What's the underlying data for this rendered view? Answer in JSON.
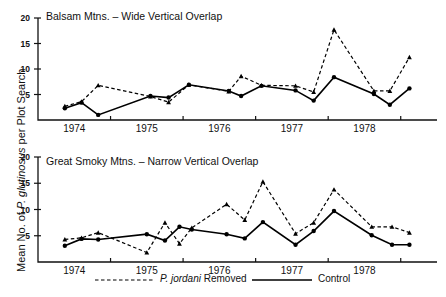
{
  "figure": {
    "y_axis_label": "Mean No. of P. glutinosus per Plot Search",
    "y_axis_label_pre": "Mean No. of ",
    "y_axis_label_italic": "P. glutinosus",
    "y_axis_label_post": " per Plot Search"
  },
  "legend": {
    "removed_pre": "",
    "removed_italic": "P. jordani",
    "removed_post": " Removed",
    "removed_label": "P. jordani Removed",
    "control_label": "Control"
  },
  "chart_data": [
    {
      "type": "line",
      "title": "Balsam Mtns. – Wide Vertical Overlap",
      "xlabel": "",
      "ylabel": "Mean No. of P. glutinosus per Plot Search",
      "ylim": [
        0,
        20
      ],
      "yticks": [
        5,
        10,
        15,
        20
      ],
      "ytick_labels": [
        "5",
        "10",
        "15",
        "20"
      ],
      "xlim": [
        1973.5,
        1979.0
      ],
      "xticks": [
        1973.5,
        1974.5,
        1975.5,
        1976.5,
        1977.5,
        1978.5
      ],
      "xtick_labels": [
        "1974",
        "1975",
        "1976",
        "1977",
        "1978"
      ],
      "grid": false,
      "legend_position": "below-figure",
      "series": [
        {
          "name": "P. jordani Removed",
          "style": "dashed",
          "marker": "triangle",
          "x": [
            1973.87,
            1974.1,
            1974.33,
            1975.05,
            1975.3,
            1975.58,
            1976.13,
            1976.3,
            1976.58,
            1977.05,
            1977.3,
            1977.58,
            1978.13,
            1978.35,
            1978.62
          ],
          "y": [
            2.7,
            3.6,
            6.8,
            4.6,
            3.5,
            6.9,
            5.6,
            8.6,
            6.8,
            6.7,
            5.5,
            17.7,
            5.7,
            5.7,
            12.3
          ]
        },
        {
          "name": "Control",
          "style": "solid",
          "marker": "circle",
          "x": [
            1973.87,
            1974.1,
            1974.33,
            1975.05,
            1975.3,
            1975.58,
            1976.13,
            1976.3,
            1976.58,
            1977.05,
            1977.3,
            1977.58,
            1978.13,
            1978.35,
            1978.62
          ],
          "y": [
            2.3,
            3.4,
            1.0,
            4.7,
            4.4,
            6.9,
            5.7,
            4.7,
            6.7,
            5.8,
            3.8,
            8.4,
            5.1,
            3.0,
            6.2
          ]
        }
      ]
    },
    {
      "type": "line",
      "title": "Great Smoky Mtns. – Narrow Vertical Overlap",
      "xlabel": "",
      "ylabel": "Mean No. of P. glutinosus per Plot Search",
      "ylim": [
        0,
        20
      ],
      "yticks": [
        5,
        10,
        15,
        20
      ],
      "ytick_labels": [
        "5",
        "10",
        "15",
        "20"
      ],
      "xlim": [
        1973.5,
        1979.0
      ],
      "xticks": [
        1973.5,
        1974.5,
        1975.5,
        1976.5,
        1977.5,
        1978.5
      ],
      "xtick_labels": [
        "1974",
        "1975",
        "1976",
        "1977",
        "1978"
      ],
      "grid": false,
      "legend_position": "below-figure",
      "series": [
        {
          "name": "P. jordani Removed",
          "style": "dashed",
          "marker": "triangle",
          "x": [
            1973.87,
            1974.1,
            1974.33,
            1975.0,
            1975.25,
            1975.45,
            1975.62,
            1976.1,
            1976.35,
            1976.6,
            1977.05,
            1977.3,
            1977.58,
            1978.1,
            1978.38,
            1978.62
          ],
          "y": [
            4.3,
            4.6,
            5.6,
            1.8,
            7.5,
            3.5,
            6.5,
            11.0,
            8.0,
            15.3,
            5.4,
            7.5,
            13.8,
            6.7,
            6.7,
            5.6
          ]
        },
        {
          "name": "Control",
          "style": "solid",
          "marker": "circle",
          "x": [
            1973.87,
            1974.1,
            1974.33,
            1975.0,
            1975.25,
            1975.45,
            1975.62,
            1976.1,
            1976.35,
            1976.6,
            1977.05,
            1977.3,
            1977.58,
            1978.1,
            1978.38,
            1978.62
          ],
          "y": [
            3.1,
            4.4,
            4.3,
            5.3,
            4.1,
            6.7,
            6.2,
            5.3,
            4.5,
            7.6,
            3.3,
            5.9,
            9.7,
            5.1,
            3.3,
            3.3
          ]
        }
      ]
    }
  ]
}
